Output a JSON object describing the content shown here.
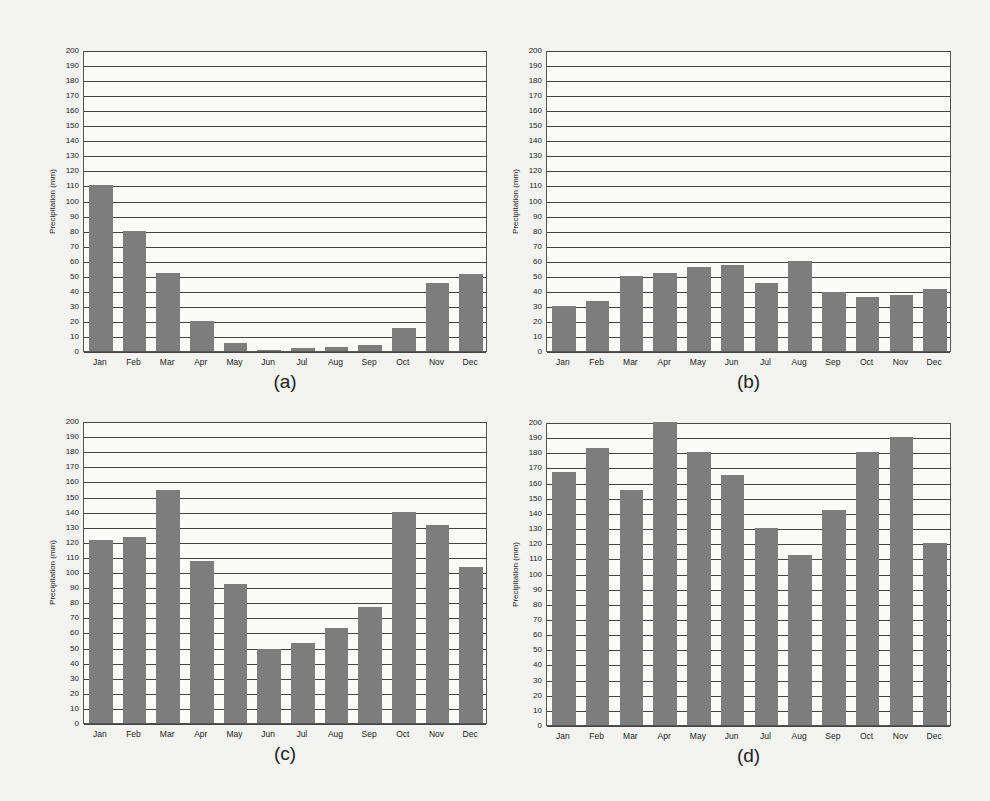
{
  "chart_data": [
    {
      "id": "a",
      "type": "bar",
      "caption": "(a)",
      "ylabel": "Precipitation (mm)",
      "xlabel": "",
      "ylim": [
        0,
        200
      ],
      "yticks": [
        0,
        10,
        20,
        30,
        40,
        50,
        60,
        70,
        80,
        90,
        100,
        110,
        120,
        130,
        140,
        150,
        160,
        170,
        180,
        190,
        200
      ],
      "categories": [
        "Jan",
        "Feb",
        "Mar",
        "Apr",
        "May",
        "Jun",
        "Jul",
        "Aug",
        "Sep",
        "Oct",
        "Nov",
        "Dec"
      ],
      "values": [
        110,
        80,
        52,
        20,
        5,
        0.5,
        2,
        3,
        4,
        15,
        45,
        51
      ],
      "grid": true
    },
    {
      "id": "b",
      "type": "bar",
      "caption": "(b)",
      "ylabel": "Precipitation (mm)",
      "xlabel": "",
      "ylim": [
        0,
        200
      ],
      "yticks": [
        0,
        10,
        20,
        30,
        40,
        50,
        60,
        70,
        80,
        90,
        100,
        110,
        120,
        130,
        140,
        150,
        160,
        170,
        180,
        190,
        200
      ],
      "categories": [
        "Jan",
        "Feb",
        "Mar",
        "Apr",
        "May",
        "Jun",
        "Jul",
        "Aug",
        "Sep",
        "Oct",
        "Nov",
        "Dec"
      ],
      "values": [
        30,
        33,
        50,
        52,
        56,
        57,
        45,
        60,
        39,
        36,
        37,
        41
      ],
      "grid": true
    },
    {
      "id": "c",
      "type": "bar",
      "caption": "(c)",
      "ylabel": "Precipitation (mm)",
      "xlabel": "",
      "ylim": [
        0,
        200
      ],
      "yticks": [
        0,
        10,
        20,
        30,
        40,
        50,
        60,
        70,
        80,
        90,
        100,
        110,
        120,
        130,
        140,
        150,
        160,
        170,
        180,
        190,
        200
      ],
      "categories": [
        "Jan",
        "Feb",
        "Mar",
        "Apr",
        "May",
        "Jun",
        "Jul",
        "Aug",
        "Sep",
        "Oct",
        "Nov",
        "Dec"
      ],
      "values": [
        121,
        123,
        154,
        107,
        92,
        49,
        53,
        63,
        77,
        140,
        131,
        103
      ],
      "grid": true
    },
    {
      "id": "d",
      "type": "bar",
      "caption": "(d)",
      "ylabel": "Precipitation (mm)",
      "xlabel": "",
      "ylim": [
        0,
        200
      ],
      "yticks": [
        0,
        10,
        20,
        30,
        40,
        50,
        60,
        70,
        80,
        90,
        100,
        110,
        120,
        130,
        140,
        150,
        160,
        170,
        180,
        190,
        200
      ],
      "categories": [
        "Jan",
        "Feb",
        "Mar",
        "Apr",
        "May",
        "Jun",
        "Jul",
        "Aug",
        "Sep",
        "Oct",
        "Nov",
        "Dec"
      ],
      "values": [
        167,
        183,
        155,
        200,
        180,
        165,
        130,
        112,
        142,
        180,
        190,
        120
      ],
      "grid": true
    }
  ],
  "style": {
    "bar_color": "#7d7d7d",
    "grid_color": "#444444"
  }
}
